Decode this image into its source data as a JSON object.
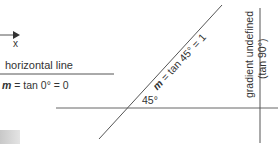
{
  "diagram": {
    "axis_label": "x",
    "horizontal": {
      "title": "horizontal line",
      "m_symbol": "m",
      "equation": " = tan 0° = 0"
    },
    "diagonal": {
      "m_symbol": "m",
      "equation": " = tan 45° = 1",
      "angle_label": "45°"
    },
    "vertical": {
      "line1": "gradient undefined",
      "line2": "(tan 90°)"
    },
    "colors": {
      "line": "#555555",
      "text": "#333333",
      "block": "#d0d0d0"
    }
  }
}
